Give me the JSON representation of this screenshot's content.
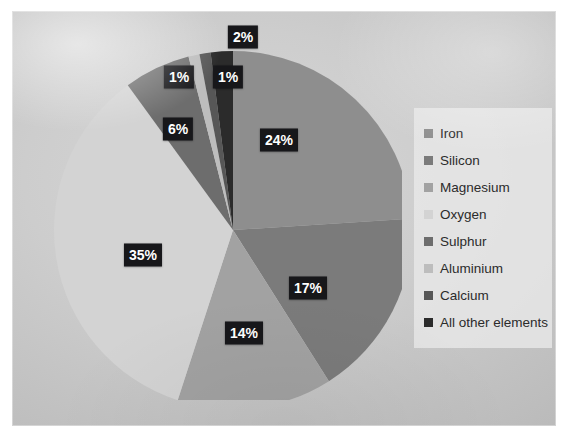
{
  "chart_data": {
    "type": "pie",
    "title": "",
    "categories": [
      "Iron",
      "Silicon",
      "Magnesium",
      "Oxygen",
      "Sulphur",
      "Aluminium",
      "Calcium",
      "All other elements"
    ],
    "values": [
      24,
      17,
      14,
      35,
      6,
      1,
      1,
      2
    ],
    "value_labels": [
      "24%",
      "17%",
      "14%",
      "35%",
      "6%",
      "1%",
      "1%",
      "2%"
    ],
    "unit": "%",
    "legend_position": "right",
    "grid": false,
    "colors": [
      "#8e8e8e",
      "#7b7b7b",
      "#a2a2a2",
      "#d3d3d3",
      "#6d6d6d",
      "#bdbdbd",
      "#575757",
      "#2b2b2b"
    ],
    "slices": [
      {
        "label": "Iron",
        "value": 24,
        "value_label": "24%",
        "color": "#8e8e8e"
      },
      {
        "label": "Silicon",
        "value": 17,
        "value_label": "17%",
        "color": "#7b7b7b"
      },
      {
        "label": "Magnesium",
        "value": 14,
        "value_label": "14%",
        "color": "#a2a2a2"
      },
      {
        "label": "Oxygen",
        "value": 35,
        "value_label": "35%",
        "color": "#d3d3d3"
      },
      {
        "label": "Sulphur",
        "value": 6,
        "value_label": "6%",
        "color": "#6d6d6d"
      },
      {
        "label": "Aluminium",
        "value": 1,
        "value_label": "1%",
        "color": "#bdbdbd"
      },
      {
        "label": "Calcium",
        "value": 1,
        "value_label": "1%",
        "color": "#575757"
      },
      {
        "label": "All other elements",
        "value": 2,
        "value_label": "2%",
        "color": "#2b2b2b"
      }
    ]
  },
  "labels": [
    {
      "text": "24%",
      "x": 267,
      "y": 129
    },
    {
      "text": "17%",
      "x": 296,
      "y": 277
    },
    {
      "text": "14%",
      "x": 232,
      "y": 322
    },
    {
      "text": "35%",
      "x": 131,
      "y": 244
    },
    {
      "text": "6%",
      "x": 166,
      "y": 118
    },
    {
      "text": "1%",
      "x": 167,
      "y": 66
    },
    {
      "text": "1%",
      "x": 216,
      "y": 66
    },
    {
      "text": "2%",
      "x": 231,
      "y": 26
    }
  ],
  "legend": {
    "items": [
      {
        "label": "Iron",
        "color": "#8e8e8e"
      },
      {
        "label": "Silicon",
        "color": "#7b7b7b"
      },
      {
        "label": "Magnesium",
        "color": "#a2a2a2"
      },
      {
        "label": "Oxygen",
        "color": "#d3d3d3"
      },
      {
        "label": "Sulphur",
        "color": "#6d6d6d"
      },
      {
        "label": "Aluminium",
        "color": "#bdbdbd"
      },
      {
        "label": "Calcium",
        "color": "#575757"
      },
      {
        "label": "All other elements",
        "color": "#2b2b2b"
      }
    ]
  },
  "theme": {
    "board_color": "#cdcdcd",
    "label_bg": "#17171a",
    "label_fg": "#ffffff",
    "legend_bg": "#e9e9e9"
  }
}
